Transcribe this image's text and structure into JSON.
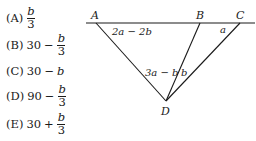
{
  "choices": [
    {
      "letter": "(A)",
      "prefix": "",
      "op": "",
      "numerator": "b",
      "denominator": "3",
      "simple": ""
    },
    {
      "letter": "(B)",
      "prefix": "30",
      "op": "−",
      "numerator": "b",
      "denominator": "3",
      "simple": ""
    },
    {
      "letter": "(C)",
      "prefix": "30",
      "op": "−",
      "numerator": "",
      "denominator": "",
      "simple": "b"
    },
    {
      "letter": "(D)",
      "prefix": "90",
      "op": "−",
      "numerator": "b",
      "denominator": "3",
      "simple": ""
    },
    {
      "letter": "(E)",
      "prefix": "30",
      "op": "+",
      "numerator": "b",
      "denominator": "3",
      "simple": ""
    }
  ],
  "diagram": {
    "points": {
      "A": "A",
      "B": "B",
      "C": "C",
      "D": "D"
    },
    "angles": {
      "at_A": "2a − 2b",
      "at_C": "a",
      "at_D_left": "3a − b",
      "at_D_right": "b"
    },
    "line_color": "#1a1a1a"
  }
}
